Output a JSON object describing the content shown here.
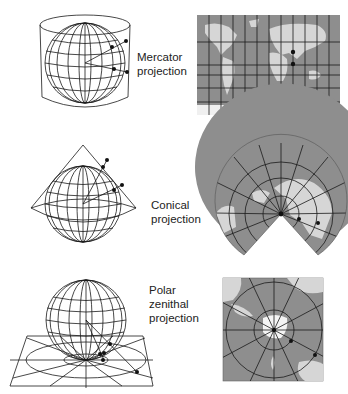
{
  "figure": {
    "colors": {
      "line": "#1a1a1a",
      "map_ocean": "#8e8e8e",
      "map_land": "#d6d6d6",
      "ice": "#f4f4f4",
      "background": "#ffffff"
    },
    "projections": [
      {
        "id": "mercator",
        "label_line1": "Mercator",
        "label_line2": "projection",
        "label_line3": "",
        "surface": "cylinder",
        "map_shape": "rectangle-grid"
      },
      {
        "id": "conical",
        "label_line1": "Conical",
        "label_line2": "projection",
        "label_line3": "",
        "surface": "cone",
        "map_shape": "fan-sector"
      },
      {
        "id": "polar-zenithal",
        "label_line1": "Polar",
        "label_line2": "zenithal",
        "label_line3": "projection",
        "surface": "plane",
        "map_shape": "square-radial"
      }
    ]
  }
}
